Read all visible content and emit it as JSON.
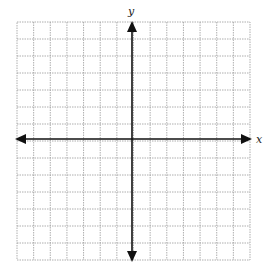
{
  "diagram": {
    "type": "coordinate-grid",
    "x_axis_label": "x",
    "y_axis_label": "y",
    "grid": {
      "columns": 14,
      "rows": 14,
      "left": 17,
      "top": 22,
      "right": 250,
      "bottom": 260,
      "line_color": "#9a9a9a",
      "line_style": "dotted"
    },
    "axes": {
      "origin_x": 132,
      "origin_y": 139,
      "color": "#111111",
      "arrows": [
        "left",
        "right",
        "up",
        "down"
      ]
    }
  }
}
